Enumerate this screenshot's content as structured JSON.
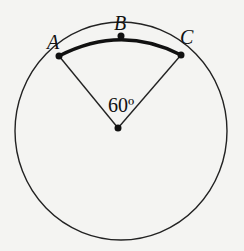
{
  "diagram": {
    "type": "circle-sector",
    "points": [
      {
        "label": "A",
        "role": "arc endpoint"
      },
      {
        "label": "B",
        "role": "arc midpoint"
      },
      {
        "label": "C",
        "role": "arc endpoint"
      }
    ],
    "center_angle_label": "60º",
    "highlighted_arc": "ABC",
    "colors": {
      "stroke": "#111111",
      "background": "#f4f4f2"
    }
  }
}
